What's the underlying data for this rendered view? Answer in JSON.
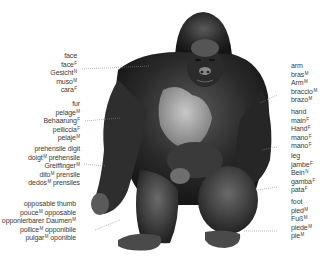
{
  "diagram": {
    "left_labels": [
      {
        "id": "face",
        "terms": [
          {
            "text": "face",
            "g": ""
          },
          {
            "text": "face",
            "g": "F"
          },
          {
            "text": "Gesicht",
            "g": "N"
          },
          {
            "text": "muso",
            "g": "M"
          },
          {
            "text": "cara",
            "g": "F"
          }
        ]
      },
      {
        "id": "fur",
        "terms": [
          {
            "text": "fur",
            "g": ""
          },
          {
            "text": "pelage",
            "g": "M"
          },
          {
            "text": "Behaarung",
            "g": "F"
          },
          {
            "text": "pelliccia",
            "g": "F"
          },
          {
            "text": "pelaje",
            "g": "M"
          }
        ]
      },
      {
        "id": "prehensile-digit",
        "terms": [
          {
            "text": "prehensile digit",
            "g": ""
          },
          {
            "text": "doigt",
            "g": "M",
            "suffix": " préhensile"
          },
          {
            "text": "Greiffinger",
            "g": "M"
          },
          {
            "text": "dito",
            "g": "M",
            "suffix": " prensile"
          },
          {
            "text": "dedos",
            "g": "M",
            "suffix": " prensiles"
          }
        ]
      },
      {
        "id": "opposable-thumb",
        "terms": [
          {
            "text": "opposable thumb",
            "g": ""
          },
          {
            "text": "pouce",
            "g": "M",
            "suffix": " opposable"
          },
          {
            "text": "opponierbarer Daumen",
            "g": "M"
          },
          {
            "text": "pollice",
            "g": "M",
            "suffix": " opponibile"
          },
          {
            "text": "pulgar",
            "g": "M",
            "suffix": " oponible"
          }
        ]
      }
    ],
    "right_labels": [
      {
        "id": "arm",
        "terms": [
          {
            "text": "arm",
            "g": ""
          },
          {
            "text": "bras",
            "g": "M"
          },
          {
            "text": "Arm",
            "g": "M"
          },
          {
            "text": "braccio",
            "g": "M"
          },
          {
            "text": "brazo",
            "g": "M"
          }
        ]
      },
      {
        "id": "hand",
        "terms": [
          {
            "text": "hand",
            "g": ""
          },
          {
            "text": "main",
            "g": "F"
          },
          {
            "text": "Hand",
            "g": "F"
          },
          {
            "text": "mano",
            "g": "F"
          },
          {
            "text": "mano",
            "g": "F"
          }
        ]
      },
      {
        "id": "leg",
        "terms": [
          {
            "text": "leg",
            "g": ""
          },
          {
            "text": "jambe",
            "g": "F"
          },
          {
            "text": "Bein",
            "g": "N"
          },
          {
            "text": "gamba",
            "g": "F"
          },
          {
            "text": "pata",
            "g": "F"
          }
        ]
      },
      {
        "id": "foot",
        "terms": [
          {
            "text": "foot",
            "g": ""
          },
          {
            "text": "pied",
            "g": "M"
          },
          {
            "text": "Fuß",
            "g": "M"
          },
          {
            "text": "piede",
            "g": "M"
          },
          {
            "text": "pie",
            "g": "M"
          }
        ]
      }
    ]
  }
}
